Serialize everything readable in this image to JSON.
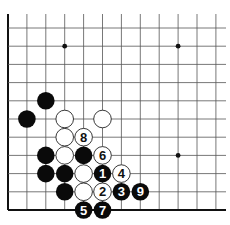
{
  "diagram": {
    "type": "go-board-corner",
    "grid": {
      "origin_x": 8,
      "origin_y": 28,
      "spacing_x": 18.9,
      "spacing_y": 18.2,
      "cols": 12,
      "rows": 11,
      "top_extend_y": 14,
      "right_extend_x": 226,
      "line_color": "#555555",
      "edge_color": "#111111"
    },
    "star_points": [
      {
        "col": 3,
        "row": 1
      },
      {
        "col": 9,
        "row": 1
      },
      {
        "col": 9,
        "row": 7
      }
    ],
    "stones": [
      {
        "color": "black",
        "col": 2,
        "row": 4,
        "label": ""
      },
      {
        "color": "black",
        "col": 1,
        "row": 5,
        "label": ""
      },
      {
        "color": "white",
        "col": 3,
        "row": 5,
        "label": ""
      },
      {
        "color": "white",
        "col": 5,
        "row": 5,
        "label": ""
      },
      {
        "color": "white",
        "col": 3,
        "row": 6,
        "label": ""
      },
      {
        "color": "white",
        "col": 4,
        "row": 6,
        "label": "8"
      },
      {
        "color": "black",
        "col": 2,
        "row": 7,
        "label": ""
      },
      {
        "color": "white",
        "col": 3,
        "row": 7,
        "label": ""
      },
      {
        "color": "black",
        "col": 4,
        "row": 7,
        "label": ""
      },
      {
        "color": "white",
        "col": 5,
        "row": 7,
        "label": "6"
      },
      {
        "color": "black",
        "col": 2,
        "row": 8,
        "label": ""
      },
      {
        "color": "black",
        "col": 3,
        "row": 8,
        "label": ""
      },
      {
        "color": "white",
        "col": 4,
        "row": 8,
        "label": ""
      },
      {
        "color": "black",
        "col": 5,
        "row": 8,
        "label": "1"
      },
      {
        "color": "white",
        "col": 6,
        "row": 8,
        "label": "4"
      },
      {
        "color": "black",
        "col": 3,
        "row": 9,
        "label": ""
      },
      {
        "color": "white",
        "col": 4,
        "row": 9,
        "label": ""
      },
      {
        "color": "white",
        "col": 5,
        "row": 9,
        "label": "2"
      },
      {
        "color": "black",
        "col": 6,
        "row": 9,
        "label": "3"
      },
      {
        "color": "black",
        "col": 7,
        "row": 9,
        "label": "9"
      },
      {
        "color": "black",
        "col": 4,
        "row": 10,
        "label": "5"
      },
      {
        "color": "black",
        "col": 5,
        "row": 10,
        "label": "7"
      }
    ],
    "colors": {
      "black_stone": "#0a0a0a",
      "white_stone": "#ffffff",
      "white_stone_border": "#222222",
      "background": "#ffffff"
    }
  }
}
